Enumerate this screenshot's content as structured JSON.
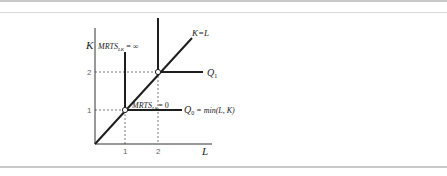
{
  "figure": {
    "type": "leontief-isoquant",
    "axes": {
      "x_label": "L",
      "y_label": "K",
      "x_ticks": [
        "1",
        "2"
      ],
      "y_ticks": [
        "1",
        "2"
      ]
    },
    "ray_label": "K=L",
    "isoquants": [
      {
        "name": "Q0",
        "label_main": "Q",
        "label_sub": "0",
        "formula": " = min(L, K)",
        "corner": [
          1,
          1
        ]
      },
      {
        "name": "Q1",
        "label_main": "Q",
        "label_sub": "1",
        "corner": [
          2,
          2
        ]
      }
    ],
    "annotations": {
      "mrts_inf": {
        "main": "MRTS",
        "sub": "LK",
        "rest": " = ∞"
      },
      "mrts_zero": {
        "main": "MRTS",
        "sub": "LK",
        "rest": "= 0"
      }
    }
  },
  "colors": {
    "line": "#1e1e1e",
    "dotted": "#555555",
    "rule": "#c9c9c9"
  }
}
